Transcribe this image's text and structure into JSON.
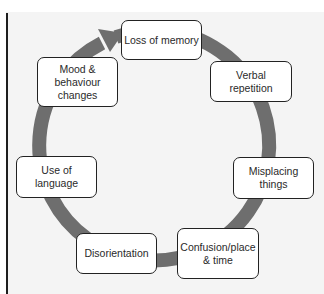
{
  "diagram": {
    "type": "cycle",
    "colors": {
      "ring": "#6e6e6e",
      "background": "#f4f4f4",
      "node_fill": "#ffffff",
      "node_border": "#222222"
    },
    "nodes": [
      {
        "label": "Loss of memory"
      },
      {
        "label": "Verbal\nrepetition"
      },
      {
        "label": "Misplacing\nthings"
      },
      {
        "label": "Confusion/place\n& time"
      },
      {
        "label": "Disorientation"
      },
      {
        "label": "Use of language"
      },
      {
        "label": "Mood &\nbehaviour\nchanges"
      }
    ]
  }
}
